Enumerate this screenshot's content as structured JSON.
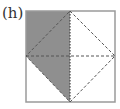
{
  "figure": {
    "label": "(h)",
    "colors": {
      "shade": "#8f8f8f",
      "border": "#9a9a9a",
      "dashed": "#555555",
      "background": "#ffffff"
    },
    "square": {
      "x": 26,
      "y": 11,
      "size": 90
    },
    "shaded_region": "left portion: top-left corner, top midpoint, bottom midpoint, left midpoint",
    "lines": [
      {
        "name": "vertical-midline",
        "style": "dotted"
      },
      {
        "name": "horizontal-midline",
        "style": "dashed"
      },
      {
        "name": "diamond-inscribed",
        "style": "dashed"
      }
    ]
  }
}
